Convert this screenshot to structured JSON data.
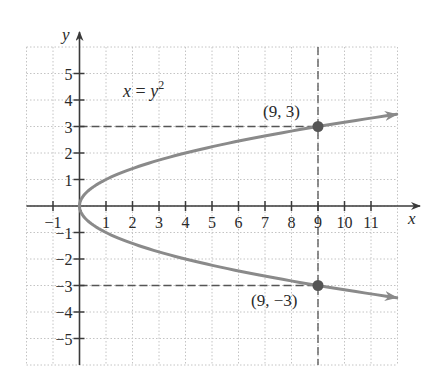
{
  "chart_data": {
    "type": "line",
    "title": "",
    "xlabel": "x",
    "ylabel": "y",
    "xlim": [
      -2,
      12
    ],
    "ylim": [
      -6,
      6
    ],
    "grid": true,
    "x_ticks": [
      -1,
      1,
      2,
      3,
      4,
      5,
      6,
      7,
      8,
      9,
      10,
      11
    ],
    "y_ticks": [
      -5,
      -4,
      -3,
      -2,
      -1,
      1,
      2,
      3,
      4,
      5
    ],
    "series": [
      {
        "name": "x = y^2",
        "equation": "x = y²",
        "color": "#8a8a8a",
        "y_range": [
          -3.46,
          3.46
        ],
        "points": [
          {
            "x": 0,
            "y": 0
          },
          {
            "x": 1,
            "y": 1
          },
          {
            "x": 1,
            "y": -1
          },
          {
            "x": 4,
            "y": 2
          },
          {
            "x": 4,
            "y": -2
          },
          {
            "x": 9,
            "y": 3
          },
          {
            "x": 9,
            "y": -3
          },
          {
            "x": 12,
            "y": 3.46
          },
          {
            "x": 12,
            "y": -3.46
          }
        ]
      }
    ],
    "highlighted_points": [
      {
        "x": 9,
        "y": 3,
        "label": "(9, 3)"
      },
      {
        "x": 9,
        "y": -3,
        "label": "(9, −3)"
      }
    ],
    "reference_lines": [
      {
        "type": "vertical",
        "x": 9,
        "style": "dashed"
      },
      {
        "type": "horizontal",
        "y": 3,
        "from_x": 0,
        "to_x": 9,
        "style": "dashed"
      },
      {
        "type": "horizontal",
        "y": -3,
        "from_x": 0,
        "to_x": 9,
        "style": "dashed"
      }
    ],
    "annotations": [
      {
        "text": "x = y²",
        "x": 2.4,
        "y": 4.2
      }
    ]
  },
  "labels": {
    "x_axis": "x",
    "y_axis": "y",
    "equation_lhs": "x",
    "equation_eq": " = ",
    "equation_rhs": "y",
    "equation_exp": "2",
    "point_upper": "(9, 3)",
    "point_lower": "(9, −3)"
  },
  "colors": {
    "curve": "#8a8a8a",
    "axis": "#3a3a3a",
    "grid": "#c4c4c4",
    "point": "#555555"
  }
}
